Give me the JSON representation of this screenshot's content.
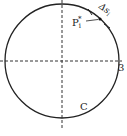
{
  "diagram": {
    "type": "circle-curve-partition",
    "curve_label": "C",
    "point_label_base": "P",
    "point_label_sub": "i",
    "point_label_sup": "*",
    "arc_label_base": "Δs",
    "arc_label_sub": "i",
    "axis_label_right": "3",
    "colors": {
      "stroke": "#222222",
      "background": "#ffffff"
    }
  }
}
